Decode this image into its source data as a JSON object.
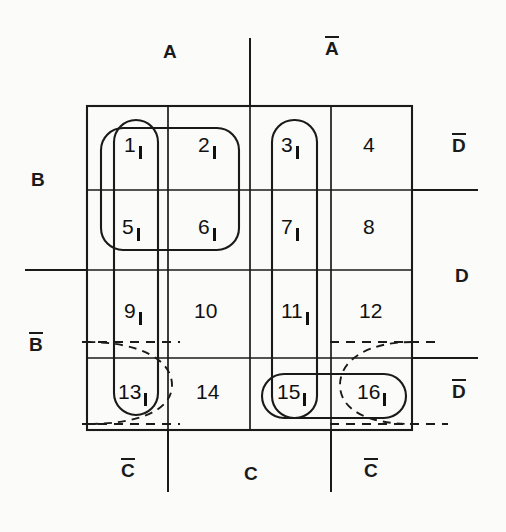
{
  "figure": {
    "type": "karnaugh-map",
    "variables": [
      "A",
      "B",
      "C",
      "D"
    ]
  },
  "labels": {
    "top": [
      {
        "id": "A",
        "text": "A",
        "overbar": false
      },
      {
        "id": "A-not",
        "text": "A",
        "overbar": true
      }
    ],
    "bottom": [
      {
        "id": "C-not-left",
        "text": "C",
        "overbar": true
      },
      {
        "id": "C-mid",
        "text": "C",
        "overbar": false
      },
      {
        "id": "C-not-right",
        "text": "C",
        "overbar": true
      }
    ],
    "left": [
      {
        "id": "B",
        "text": "B",
        "overbar": false
      },
      {
        "id": "B-not",
        "text": "B",
        "overbar": true
      }
    ],
    "right": [
      {
        "id": "D-not-top",
        "text": "D",
        "overbar": true
      },
      {
        "id": "D",
        "text": "D",
        "overbar": false
      },
      {
        "id": "D-not-bottom",
        "text": "D",
        "overbar": true
      }
    ]
  },
  "grid": {
    "rows": 4,
    "cols": 4,
    "cells": [
      {
        "number": "1",
        "value": "1"
      },
      {
        "number": "2",
        "value": "1"
      },
      {
        "number": "3",
        "value": "1"
      },
      {
        "number": "4",
        "value": ""
      },
      {
        "number": "5",
        "value": "1"
      },
      {
        "number": "6",
        "value": "1"
      },
      {
        "number": "7",
        "value": "1"
      },
      {
        "number": "8",
        "value": ""
      },
      {
        "number": "9",
        "value": "1"
      },
      {
        "number": "10",
        "value": ""
      },
      {
        "number": "11",
        "value": "1"
      },
      {
        "number": "12",
        "value": ""
      },
      {
        "number": "13",
        "value": "1"
      },
      {
        "number": "14",
        "value": ""
      },
      {
        "number": "15",
        "value": "1"
      },
      {
        "number": "16",
        "value": "1"
      }
    ]
  },
  "groupings": [
    {
      "id": "group-1-2-5-6",
      "style": "solid",
      "shape": "rounded-rect",
      "cells": [
        "1",
        "2",
        "5",
        "6"
      ]
    },
    {
      "id": "group-1-5-9-13",
      "style": "solid",
      "shape": "vertical-oval",
      "cells": [
        "1",
        "5",
        "9",
        "13"
      ]
    },
    {
      "id": "group-3-7-11-15",
      "style": "solid",
      "shape": "vertical-oval",
      "cells": [
        "3",
        "7",
        "11",
        "15"
      ]
    },
    {
      "id": "group-15-16",
      "style": "solid",
      "shape": "horizontal-oval",
      "cells": [
        "15",
        "16"
      ]
    },
    {
      "id": "group-13-16-wrap",
      "style": "dashed",
      "shape": "corner-oval",
      "cells": [
        "13",
        "16"
      ]
    }
  ],
  "colors": {
    "line": "#1a1a1a",
    "background": "#fbfbf9",
    "text": "#111111"
  }
}
